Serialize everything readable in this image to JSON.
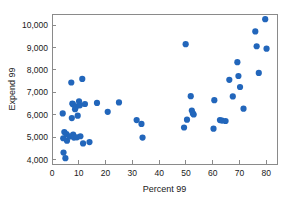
{
  "chart_data": {
    "type": "scatter",
    "title": "",
    "xlabel": "Percent 99",
    "ylabel": "Expend 99",
    "xlim": [
      0,
      84
    ],
    "ylim": [
      3800,
      10500
    ],
    "xticks": [
      0,
      10,
      20,
      30,
      40,
      50,
      60,
      70,
      80
    ],
    "xtick_labels": [
      "0",
      "10",
      "20",
      "30",
      "40",
      "50",
      "60",
      "70",
      "80"
    ],
    "yticks": [
      4000,
      5000,
      6000,
      7000,
      8000,
      9000,
      10000
    ],
    "ytick_labels": [
      "4,000",
      "5,000",
      "6,000",
      "7,000",
      "8,000",
      "9,000",
      "10,000"
    ],
    "grid": false,
    "legend": "none",
    "marker_color": "#2266BB",
    "marker_size": 3.1,
    "points": [
      {
        "x": 4.0,
        "y": 6060
      },
      {
        "x": 4.2,
        "y": 4950
      },
      {
        "x": 4.3,
        "y": 4310
      },
      {
        "x": 4.6,
        "y": 5230
      },
      {
        "x": 5.0,
        "y": 4060
      },
      {
        "x": 5.4,
        "y": 5130
      },
      {
        "x": 5.6,
        "y": 4840
      },
      {
        "x": 6.6,
        "y": 5030
      },
      {
        "x": 7.2,
        "y": 7440
      },
      {
        "x": 7.4,
        "y": 5850
      },
      {
        "x": 7.6,
        "y": 6500
      },
      {
        "x": 7.8,
        "y": 6470
      },
      {
        "x": 7.9,
        "y": 5110
      },
      {
        "x": 8.2,
        "y": 4980
      },
      {
        "x": 8.6,
        "y": 6250
      },
      {
        "x": 8.8,
        "y": 6340
      },
      {
        "x": 9.0,
        "y": 6380
      },
      {
        "x": 9.3,
        "y": 4990
      },
      {
        "x": 9.6,
        "y": 5960
      },
      {
        "x": 10.1,
        "y": 6600
      },
      {
        "x": 10.4,
        "y": 6420
      },
      {
        "x": 10.6,
        "y": 5040
      },
      {
        "x": 11.3,
        "y": 7600
      },
      {
        "x": 11.6,
        "y": 4720
      },
      {
        "x": 12.3,
        "y": 6480
      },
      {
        "x": 14.0,
        "y": 4780
      },
      {
        "x": 16.8,
        "y": 6530
      },
      {
        "x": 20.8,
        "y": 6130
      },
      {
        "x": 25.0,
        "y": 6550
      },
      {
        "x": 31.6,
        "y": 5760
      },
      {
        "x": 33.4,
        "y": 5590
      },
      {
        "x": 33.8,
        "y": 4980
      },
      {
        "x": 49.3,
        "y": 5430
      },
      {
        "x": 49.9,
        "y": 9150
      },
      {
        "x": 50.4,
        "y": 5780
      },
      {
        "x": 51.8,
        "y": 6830
      },
      {
        "x": 52.2,
        "y": 6190
      },
      {
        "x": 52.6,
        "y": 6060
      },
      {
        "x": 52.9,
        "y": 6010
      },
      {
        "x": 60.3,
        "y": 5380
      },
      {
        "x": 60.6,
        "y": 6650
      },
      {
        "x": 62.7,
        "y": 5760
      },
      {
        "x": 63.5,
        "y": 5740
      },
      {
        "x": 64.8,
        "y": 5720
      },
      {
        "x": 66.2,
        "y": 7560
      },
      {
        "x": 67.5,
        "y": 6820
      },
      {
        "x": 69.2,
        "y": 8350
      },
      {
        "x": 69.6,
        "y": 7730
      },
      {
        "x": 70.2,
        "y": 7240
      },
      {
        "x": 71.5,
        "y": 6270
      },
      {
        "x": 75.9,
        "y": 9720
      },
      {
        "x": 76.4,
        "y": 9060
      },
      {
        "x": 77.2,
        "y": 7870
      },
      {
        "x": 79.6,
        "y": 10270
      },
      {
        "x": 80.1,
        "y": 8950
      }
    ]
  }
}
